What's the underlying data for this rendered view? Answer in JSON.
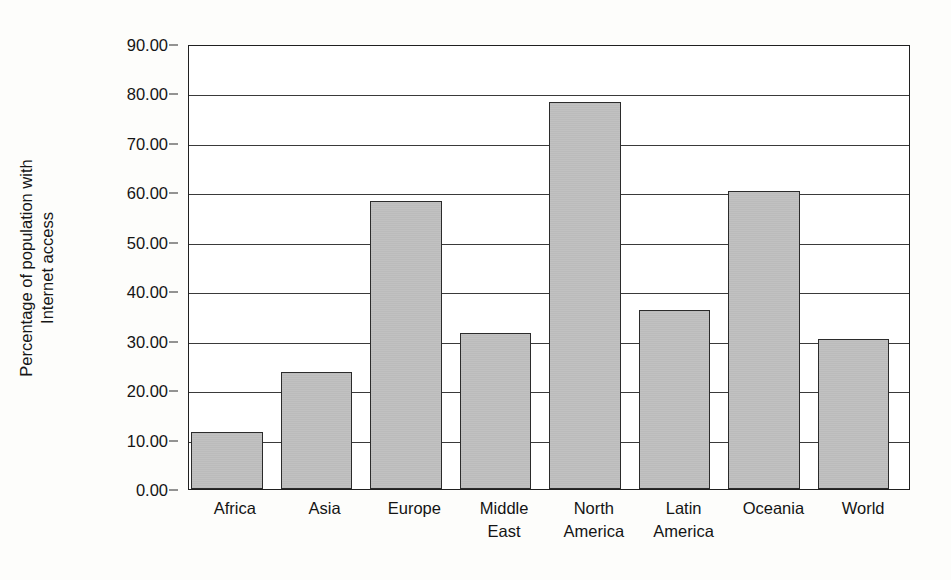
{
  "chart_data": {
    "type": "bar",
    "title": "",
    "xlabel": "",
    "ylabel": "Percentage of population with Internet access",
    "ylabel_lines": [
      "Percentage of population with",
      "Internet access"
    ],
    "categories": [
      "Africa",
      "Asia",
      "Europe",
      "Middle East",
      "North America",
      "Latin America",
      "Oceania",
      "World"
    ],
    "category_lines": [
      [
        "Africa"
      ],
      [
        "Asia"
      ],
      [
        "Europe"
      ],
      [
        "Middle",
        "East"
      ],
      [
        "North",
        "America"
      ],
      [
        "Latin",
        "America"
      ],
      [
        "Oceania"
      ],
      [
        "World"
      ]
    ],
    "values": [
      11.5,
      23.6,
      58.3,
      31.6,
      78.2,
      36.2,
      60.2,
      30.4
    ],
    "ylim": [
      0,
      90
    ],
    "ytick_labels": [
      "0.00",
      "10.00",
      "20.00",
      "30.00",
      "40.00",
      "50.00",
      "60.00",
      "70.00",
      "80.00",
      "90.00"
    ],
    "ytick_values": [
      0,
      10,
      20,
      30,
      40,
      50,
      60,
      70,
      80,
      90
    ],
    "grid": "horizontal",
    "legend": "none",
    "bar_fill_color": "#bfbfbf",
    "bar_border_color": "#2b2b2b",
    "axis_color": "#202020",
    "background_color": "#fdfdfb"
  }
}
